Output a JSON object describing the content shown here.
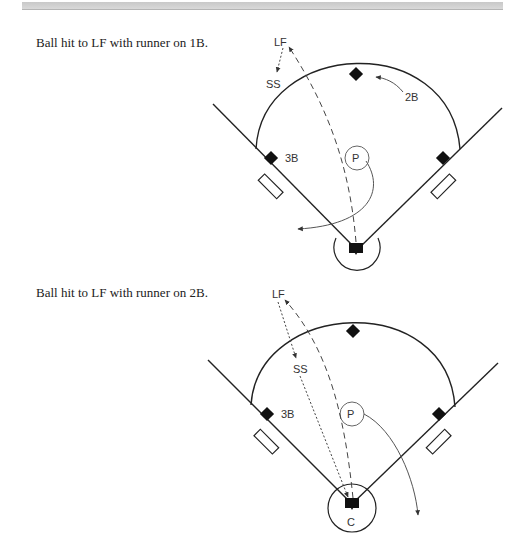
{
  "diagrams": [
    {
      "caption": "Ball hit to LF with runner on 1B.",
      "labels": {
        "lf": "LF",
        "ss": "SS",
        "second_base": "2B",
        "third_base": "3B",
        "pitcher": "P"
      }
    },
    {
      "caption": "Ball hit to LF with runner on 2B.",
      "labels": {
        "lf": "LF",
        "ss": "SS",
        "third_base": "3B",
        "pitcher": "P",
        "catcher": "C"
      }
    }
  ],
  "colors": {
    "line": "#222222",
    "base": "#111111",
    "arrow": "#555555"
  }
}
